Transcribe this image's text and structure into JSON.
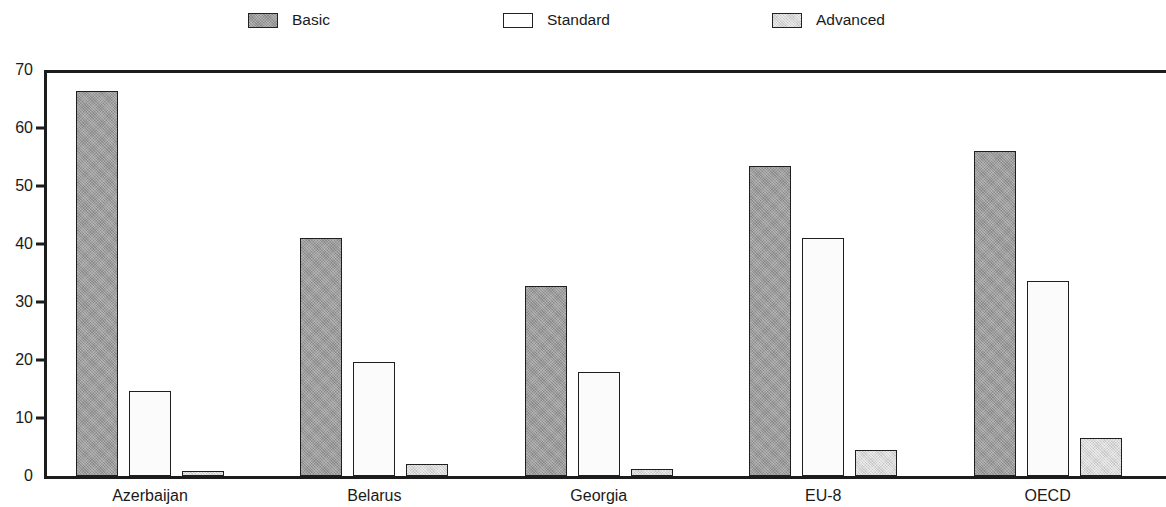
{
  "chart_data": {
    "type": "bar",
    "title": "",
    "subtitle": "",
    "xlabel": "",
    "ylabel": "",
    "categories": [
      "Azerbaijan",
      "Belarus",
      "Georgia",
      "EU-8",
      "OECD"
    ],
    "series": [
      {
        "name": "Basic",
        "values": [
          66.4,
          41.0,
          32.7,
          53.4,
          56.1
        ],
        "color": "#9a9a9a"
      },
      {
        "name": "Standard",
        "values": [
          14.7,
          19.7,
          17.9,
          41.1,
          33.6
        ],
        "color": "#fbfbfb"
      },
      {
        "name": "Advanced",
        "values": [
          0.8,
          2.0,
          1.2,
          4.4,
          6.6
        ],
        "color": "#d7d7d7"
      }
    ],
    "ylim": [
      0,
      70
    ],
    "yticks": [
      0,
      10,
      20,
      30,
      40,
      50,
      60,
      70
    ],
    "ytick_labels": [
      "0",
      "10",
      "20",
      "30",
      "40",
      "50",
      "60",
      "70"
    ],
    "grid": false,
    "legend_position": "top",
    "orientation": "vertical",
    "grouping": "grouped"
  },
  "legend": {
    "items": [
      {
        "label": "Basic"
      },
      {
        "label": "Standard"
      },
      {
        "label": "Advanced"
      }
    ]
  },
  "axes": {
    "y": {
      "labels": [
        "70",
        "60",
        "50",
        "40",
        "30",
        "20",
        "10",
        "0"
      ]
    },
    "x": {
      "labels": [
        "Azerbaijan",
        "Belarus",
        "Georgia",
        "EU-8",
        "OECD"
      ]
    }
  }
}
